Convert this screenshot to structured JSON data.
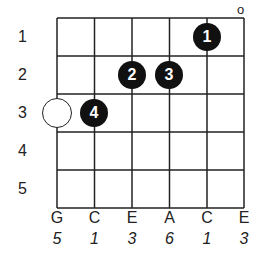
{
  "diagram": {
    "type": "chord-diagram",
    "strings": [
      {
        "name": "G",
        "finger": "5"
      },
      {
        "name": "C",
        "finger": "1"
      },
      {
        "name": "E",
        "finger": "3"
      },
      {
        "name": "A",
        "finger": "6"
      },
      {
        "name": "C",
        "finger": "1"
      },
      {
        "name": "E",
        "finger": "3"
      }
    ],
    "frets": [
      "1",
      "2",
      "3",
      "4",
      "5"
    ],
    "open_marker": {
      "string_index": 5,
      "symbol": "o"
    },
    "dots": [
      {
        "string_index": 4,
        "fret": 1,
        "label": "1"
      },
      {
        "string_index": 2,
        "fret": 2,
        "label": "2"
      },
      {
        "string_index": 3,
        "fret": 2,
        "label": "3"
      },
      {
        "string_index": 1,
        "fret": 3,
        "label": "4"
      }
    ],
    "rings": [
      {
        "string_index": 0,
        "fret": 3
      }
    ],
    "colors": {
      "line": "#222222",
      "dot": "#111111",
      "dot_text": "#ffffff",
      "background": "#ffffff"
    }
  }
}
